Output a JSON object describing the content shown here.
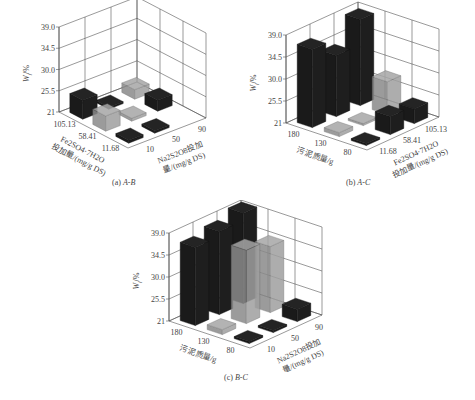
{
  "figure": {
    "panels": [
      {
        "id": "a",
        "caption_prefix": "(a)",
        "caption_italic": "A-B"
      },
      {
        "id": "b",
        "caption_prefix": "(b)",
        "caption_italic": "A-C"
      },
      {
        "id": "c",
        "caption_prefix": "(c)",
        "caption_italic": "B-C"
      }
    ]
  },
  "colors": {
    "bar_dark": "#1a1a1a",
    "bar_gray": "#8a8a8a",
    "grid": "#555555",
    "text": "#444444"
  },
  "chart_data": [
    {
      "type": "bar3d",
      "title": "(a) A-B",
      "zlabel": "W_f/%",
      "z_ticks": [
        "21",
        "25.5",
        "30.0",
        "34.5",
        "39.0"
      ],
      "zlim": [
        21,
        39
      ],
      "left_axis": {
        "label_line1": "Fe2SO4·7H2O",
        "label_line2": "投加量/(mg/g DS)",
        "ticks": [
          "105.13",
          "58.41",
          "11.68"
        ]
      },
      "right_axis": {
        "label_line1": "Na2S2O8投加",
        "label_line2": "量/(mg/g DS)",
        "ticks": [
          "10",
          "50",
          "90"
        ]
      },
      "bars": [
        {
          "left": "105.13",
          "right": "10",
          "value": 25.0,
          "color": "dark"
        },
        {
          "left": "58.41",
          "right": "10",
          "value": 24.2,
          "color": "gray"
        },
        {
          "left": "11.68",
          "right": "10",
          "value": 21.6,
          "color": "dark"
        },
        {
          "left": "105.13",
          "right": "50",
          "value": 21.3,
          "color": "dark"
        },
        {
          "left": "58.41",
          "right": "50",
          "value": 21.6,
          "color": "gray"
        },
        {
          "left": "11.68",
          "right": "50",
          "value": 21.5,
          "color": "dark"
        },
        {
          "left": "105.13",
          "right": "90",
          "value": 23.0,
          "color": "gray"
        },
        {
          "left": "58.41",
          "right": "90",
          "value": 23.3,
          "color": "dark"
        }
      ]
    },
    {
      "type": "bar3d",
      "title": "(b) A-C",
      "zlabel": "W_f/%",
      "z_ticks": [
        "21",
        "25.5",
        "30.0",
        "34.5",
        "39.0"
      ],
      "zlim": [
        21,
        39
      ],
      "left_axis": {
        "label_line1": "污泥质量/g",
        "label_line2": "",
        "ticks": [
          "180",
          "130",
          "80"
        ]
      },
      "right_axis": {
        "label_line1": "Fe2SO4·7H2O",
        "label_line2": "投加量/(mg/g DS)",
        "ticks": [
          "11.68",
          "58.41",
          "105.13"
        ]
      },
      "bars": [
        {
          "left": "180",
          "right": "11.68",
          "value": 37.0,
          "color": "dark"
        },
        {
          "left": "130",
          "right": "11.68",
          "value": 21.8,
          "color": "gray"
        },
        {
          "left": "80",
          "right": "11.68",
          "value": 21.4,
          "color": "dark"
        },
        {
          "left": "180",
          "right": "58.41",
          "value": 33.5,
          "color": "dark"
        },
        {
          "left": "130",
          "right": "58.41",
          "value": 21.3,
          "color": "gray"
        },
        {
          "left": "80",
          "right": "58.41",
          "value": 24.7,
          "color": "dark"
        },
        {
          "left": "180",
          "right": "105.13",
          "value": 38.6,
          "color": "dark"
        },
        {
          "left": "130",
          "right": "105.13",
          "value": 27.7,
          "color": "gray"
        },
        {
          "left": "80",
          "right": "105.13",
          "value": 24.0,
          "color": "dark"
        }
      ]
    },
    {
      "type": "bar3d",
      "title": "(c) B-C",
      "zlabel": "W_f/%",
      "z_ticks": [
        "21",
        "25.5",
        "30.0",
        "34.5",
        "39.0"
      ],
      "zlim": [
        21,
        39
      ],
      "left_axis": {
        "label_line1": "污泥质量/g",
        "label_line2": "",
        "ticks": [
          "180",
          "130",
          "80"
        ]
      },
      "right_axis": {
        "label_line1": "Na2S2O8投加",
        "label_line2": "量/(mg/g DS)",
        "ticks": [
          "10",
          "50",
          "90"
        ]
      },
      "bars": [
        {
          "left": "180",
          "right": "10",
          "value": 37.0,
          "color": "dark"
        },
        {
          "left": "130",
          "right": "10",
          "value": 22.0,
          "color": "gray"
        },
        {
          "left": "80",
          "right": "10",
          "value": 21.4,
          "color": "dark"
        },
        {
          "left": "180",
          "right": "50",
          "value": 38.0,
          "color": "dark"
        },
        {
          "left": "130",
          "right": "50",
          "value": 36.0,
          "color": "gray"
        },
        {
          "left": "80",
          "right": "50",
          "value": 21.3,
          "color": "dark"
        },
        {
          "left": "180",
          "right": "90",
          "value": 39.5,
          "color": "dark"
        },
        {
          "left": "130",
          "right": "90",
          "value": 34.5,
          "color": "gray"
        },
        {
          "left": "80",
          "right": "90",
          "value": 23.5,
          "color": "dark"
        }
      ]
    }
  ]
}
